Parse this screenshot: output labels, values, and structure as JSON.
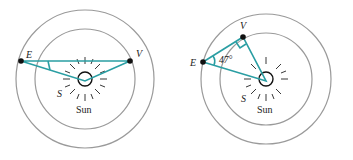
{
  "diagrams": [
    {
      "id": "left",
      "labels": {
        "earth": "E",
        "venus": "V",
        "sun_point": "S",
        "sun": "Sun"
      },
      "angle_label": ""
    },
    {
      "id": "right",
      "labels": {
        "earth": "E",
        "venus": "V",
        "sun_point": "S",
        "sun": "Sun"
      },
      "angle_label": "47°"
    }
  ],
  "colors": {
    "orbit": "#9a9a9a",
    "line": "#2a9ea3",
    "planet": "#111111"
  }
}
